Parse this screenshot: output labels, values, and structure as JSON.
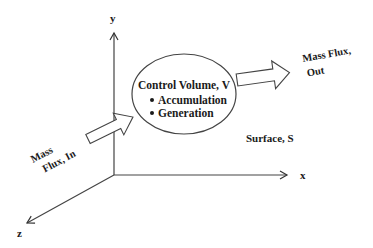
{
  "diagram": {
    "axes": {
      "x_label": "x",
      "y_label": "y",
      "z_label": "z"
    },
    "control_volume": {
      "title": "Control Volume, V",
      "items": [
        "Accumulation",
        "Generation"
      ],
      "bullet": "•"
    },
    "surface_label": "Surface, S",
    "flux_in": {
      "line1": "Mass",
      "line2": "Flux, In"
    },
    "flux_out": {
      "line1": "Mass Flux,",
      "line2": "Out"
    },
    "colors": {
      "stroke": "#333333",
      "text": "#1a1a1a",
      "background": "#ffffff"
    }
  }
}
